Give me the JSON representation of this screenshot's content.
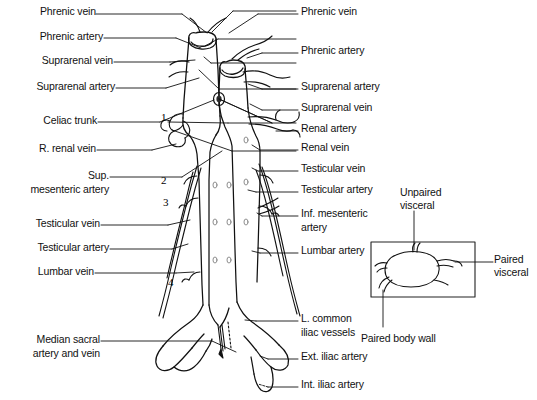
{
  "figure": {
    "line_color": "#111111",
    "background": "#ffffff"
  },
  "labels_left": [
    {
      "id": "phrenic-vein-left",
      "text": "Phrenic vein",
      "x": 160,
      "y": 11,
      "leader_to_x": 232,
      "leader_to_y": 44
    },
    {
      "id": "phrenic-artery-left",
      "text": "Phrenic artery",
      "x": 160,
      "y": 35,
      "leader_to_x": 225,
      "leader_to_y": 56
    },
    {
      "id": "suprarenal-vein-left",
      "text": "Suprarenal vein",
      "x": 160,
      "y": 59,
      "leader_to_x": 222,
      "leader_to_y": 62
    },
    {
      "id": "suprarenal-artery-left",
      "text": "Suprarenal artery",
      "x": 160,
      "y": 85,
      "leader_to_x": 225,
      "leader_to_y": 80
    },
    {
      "id": "celiac-trunk",
      "text": "Celiac trunk",
      "x": 160,
      "y": 119,
      "leader_to_x": 230,
      "leader_to_y": 100
    },
    {
      "id": "r-renal-vein",
      "text": "R. renal vein",
      "x": 160,
      "y": 147,
      "leader_to_x": 252,
      "leader_to_y": 124
    },
    {
      "id": "sup-mesenteric-artery",
      "text": "Sup.",
      "x": 160,
      "y": 174,
      "leader_to_x": 252,
      "leader_to_y": 146
    },
    {
      "id": "testicular-vein-left",
      "text": "Testicular vein",
      "x": 160,
      "y": 222,
      "leader_to_x": 200,
      "leader_to_y": 219
    },
    {
      "id": "testicular-artery-left",
      "text": "Testicular artery",
      "x": 160,
      "y": 246,
      "leader_to_x": 196,
      "leader_to_y": 237
    },
    {
      "id": "lumbar-vein",
      "text": "Lumbar vein",
      "x": 160,
      "y": 270,
      "leader_to_x": 195,
      "leader_to_y": 272
    },
    {
      "id": "median-sacral",
      "text": "Median sacral",
      "x": 160,
      "y": 338,
      "leader_to_x": 245,
      "leader_to_y": 352
    }
  ],
  "labels_left_second_lines": [
    {
      "id": "sup-mesenteric-artery-line2",
      "text": "mesenteric artery",
      "x": 160,
      "y": 188
    },
    {
      "id": "median-sacral-line2",
      "text": "artery and vein",
      "x": 160,
      "y": 352
    }
  ],
  "labels_right": [
    {
      "id": "phrenic-vein-right",
      "text": "Phrenic vein",
      "x": 302,
      "y": 11,
      "leader_from_x": 262,
      "leader_from_y": 40
    },
    {
      "id": "phrenic-artery-right",
      "text": "Phrenic artery",
      "x": 302,
      "y": 50,
      "leader_from_x": 262,
      "leader_from_y": 56
    },
    {
      "id": "suprarenal-artery-right",
      "text": "Suprarenal artery",
      "x": 302,
      "y": 86,
      "leader_from_x": 260,
      "leader_from_y": 82
    },
    {
      "id": "suprarenal-vein-right",
      "text": "Suprarenal vein",
      "x": 302,
      "y": 107,
      "leader_from_x": 262,
      "leader_from_y": 100
    },
    {
      "id": "renal-artery",
      "text": "Renal artery",
      "x": 302,
      "y": 128,
      "leader_from_x": 272,
      "leader_from_y": 127
    },
    {
      "id": "renal-vein",
      "text": "Renal vein",
      "x": 302,
      "y": 147,
      "leader_from_x": 262,
      "leader_from_y": 142
    },
    {
      "id": "testicular-vein-right",
      "text": "Testicular vein",
      "x": 302,
      "y": 168,
      "leader_from_x": 258,
      "leader_from_y": 167
    },
    {
      "id": "testicular-artery-right",
      "text": "Testicular artery",
      "x": 302,
      "y": 189,
      "leader_from_x": 258,
      "leader_from_y": 188
    },
    {
      "id": "inf-mesenteric-artery",
      "text": "Inf. mesenteric",
      "x": 302,
      "y": 213,
      "leader_from_x": 254,
      "leader_from_y": 212
    },
    {
      "id": "lumbar-artery",
      "text": "Lumbar artery",
      "x": 302,
      "y": 250,
      "leader_from_x": 254,
      "leader_from_y": 249
    },
    {
      "id": "l-common-iliac",
      "text": "L. common",
      "x": 302,
      "y": 318,
      "leader_from_x": 250,
      "leader_from_y": 317
    },
    {
      "id": "ext-iliac-artery",
      "text": "Ext. iliac artery",
      "x": 302,
      "y": 356,
      "leader_from_x": 264,
      "leader_from_y": 352
    },
    {
      "id": "int-iliac-artery",
      "text": "Int. iliac artery",
      "x": 302,
      "y": 384,
      "leader_from_x": 262,
      "leader_from_y": 380
    }
  ],
  "labels_right_second_lines": [
    {
      "id": "inf-mesenteric-artery-line2",
      "text": "artery",
      "x": 302,
      "y": 227
    },
    {
      "id": "l-common-iliac-line2",
      "text": "iliac vessels",
      "x": 302,
      "y": 331
    }
  ],
  "numerals": [
    {
      "id": "marker-1",
      "text": "1",
      "x": 162,
      "y": 112
    },
    {
      "id": "marker-2",
      "text": "2",
      "x": 162,
      "y": 175
    },
    {
      "id": "marker-3",
      "text": "3",
      "x": 164,
      "y": 197
    },
    {
      "id": "marker-4",
      "text": "4",
      "x": 169,
      "y": 277
    }
  ],
  "inset": {
    "box": {
      "x": 371,
      "y": 242,
      "width": 104,
      "height": 55
    },
    "labels": [
      {
        "id": "unpaired-visceral",
        "line1": "Unpaired",
        "line2": "visceral",
        "x": 400,
        "y": 187
      },
      {
        "id": "paired-visceral",
        "line1": "Paired",
        "line2": "visceral",
        "x": 497,
        "y": 255
      },
      {
        "id": "paired-body-wall",
        "line1": "Paired body wall",
        "line2": "",
        "x": 364,
        "y": 333
      }
    ]
  }
}
